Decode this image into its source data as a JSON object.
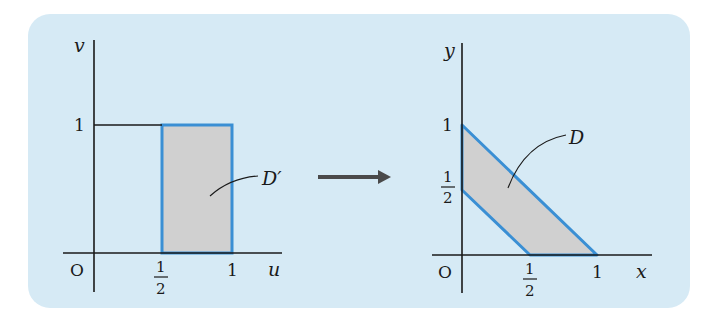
{
  "figure": {
    "background_color": "#d6eaf5",
    "region_fill": "#d0d0d0",
    "region_stroke": "#3a8fd4",
    "axis_color": "#1a1a1a",
    "arrow_color": "#4a4a4a"
  },
  "left_plot": {
    "x_axis_label": "u",
    "y_axis_label": "v",
    "origin_label": "O",
    "x_ticks": [
      {
        "num": "1",
        "den": "2"
      },
      {
        "label": "1"
      }
    ],
    "y_ticks": [
      {
        "label": "1"
      }
    ],
    "region_label": "D′",
    "region": "rectangle 1/2 ≤ u ≤ 1, 0 ≤ v ≤ 1"
  },
  "right_plot": {
    "x_axis_label": "x",
    "y_axis_label": "y",
    "origin_label": "O",
    "x_ticks": [
      {
        "num": "1",
        "den": "2"
      },
      {
        "label": "1"
      }
    ],
    "y_ticks": [
      {
        "label": "1"
      },
      {
        "num": "1",
        "den": "2"
      }
    ],
    "region_label": "D",
    "region": "trapezoid 1/2 ≤ x + y ≤ 1, x ≥ 0, y ≥ 0"
  },
  "labels": {
    "v": "v",
    "u": "u",
    "O": "O",
    "one": "1",
    "half_num": "1",
    "half_den": "2",
    "Dprime": "D′",
    "y": "y",
    "x": "x",
    "D": "D"
  }
}
